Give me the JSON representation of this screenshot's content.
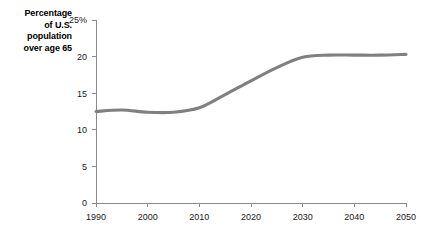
{
  "chart_data": {
    "type": "line",
    "title": "Percentage of U.S. population over age 65",
    "title_lines": [
      "Percentage",
      "of U.S.",
      "population",
      "over age 65"
    ],
    "xlabel": "",
    "ylabel": "",
    "xlim": [
      1990,
      2050
    ],
    "ylim": [
      0,
      25
    ],
    "grid": false,
    "legend": "none",
    "line_color": "#808080",
    "axis_color": "#8a8a8a",
    "x_ticks": [
      1990,
      2000,
      2010,
      2020,
      2030,
      2040,
      2050
    ],
    "x_tick_labels": [
      "1990",
      "2000",
      "2010",
      "2020",
      "2030",
      "2040",
      "2050"
    ],
    "y_ticks": [
      0,
      5,
      10,
      15,
      20,
      25
    ],
    "y_tick_labels": [
      "0",
      "5",
      "10",
      "15",
      "20",
      "25%"
    ],
    "x": [
      1990,
      1995,
      2000,
      2005,
      2010,
      2015,
      2020,
      2025,
      2030,
      2035,
      2040,
      2045,
      2050
    ],
    "values": [
      12.5,
      12.7,
      12.4,
      12.4,
      13.0,
      14.8,
      16.7,
      18.5,
      19.9,
      20.2,
      20.2,
      20.2,
      20.3
    ],
    "series": [
      {
        "name": "Percentage of U.S. population over age 65",
        "values": [
          12.5,
          12.7,
          12.4,
          12.4,
          13.0,
          14.8,
          16.7,
          18.5,
          19.9,
          20.2,
          20.2,
          20.2,
          20.3
        ]
      }
    ]
  }
}
